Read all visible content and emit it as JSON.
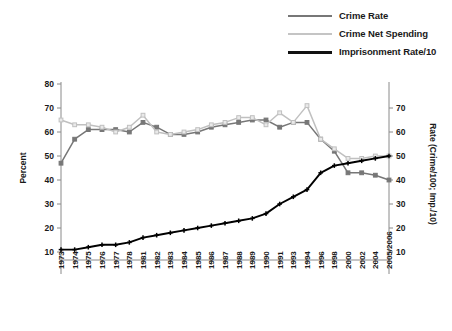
{
  "chart_data": {
    "type": "line",
    "title": "",
    "xlabel": "",
    "ylabel": "Percent",
    "y2label": "Rate (Crime/100; Imp./10)",
    "grid": false,
    "legend_position": "top-right",
    "ylim": [
      0,
      80
    ],
    "y2lim": [
      0,
      70
    ],
    "yticks": [
      10,
      20,
      30,
      40,
      50,
      60,
      70,
      80
    ],
    "y2ticks": [
      10,
      20,
      30,
      40,
      50,
      60,
      70
    ],
    "categories": [
      "1973",
      "1974",
      "1975",
      "1976",
      "1977",
      "1978",
      "1981",
      "1982",
      "1983",
      "1984",
      "1985",
      "1986",
      "1987",
      "1988",
      "1989",
      "1990",
      "1991",
      "1993",
      "1994",
      "1996",
      "1998",
      "2000",
      "2002",
      "2004",
      "2005/2006"
    ],
    "series": [
      {
        "name": "Crime Rate",
        "color": "#777777",
        "marker": "square",
        "axis": "left",
        "values": [
          47,
          57,
          61,
          61,
          61,
          60,
          64,
          62,
          59,
          59,
          60,
          62,
          63,
          64,
          65,
          65,
          62,
          64,
          64,
          57,
          52,
          43,
          43,
          42,
          40
        ]
      },
      {
        "name": "Crime Net Spending",
        "color": "#c0c0c0",
        "marker": "square",
        "axis": "left",
        "values": [
          65,
          63,
          63,
          62,
          60,
          62,
          67,
          60,
          59,
          60,
          61,
          63,
          64,
          66,
          66,
          63,
          68,
          64,
          71,
          57,
          53,
          49,
          49,
          50,
          50
        ]
      },
      {
        "name": "Imprisonment Rate/10",
        "color": "#000000",
        "marker": "plus",
        "axis": "left",
        "values": [
          11,
          11,
          12,
          13,
          13,
          14,
          16,
          17,
          18,
          19,
          20,
          21,
          22,
          23,
          24,
          26,
          30,
          33,
          36,
          43,
          46,
          47,
          48,
          49,
          50
        ]
      }
    ],
    "legend": [
      {
        "label": "Crime Rate",
        "color": "#777777",
        "thickness": 2.6
      },
      {
        "label": "Crime Net Spending",
        "color": "#c4c4c4",
        "thickness": 2.2
      },
      {
        "label": "Imprisonment Rate/10",
        "color": "#111111",
        "thickness": 3.0
      }
    ]
  },
  "colors": {
    "axis": "#8a8a8a",
    "text": "#1a1a1a",
    "background": "#ffffff"
  }
}
